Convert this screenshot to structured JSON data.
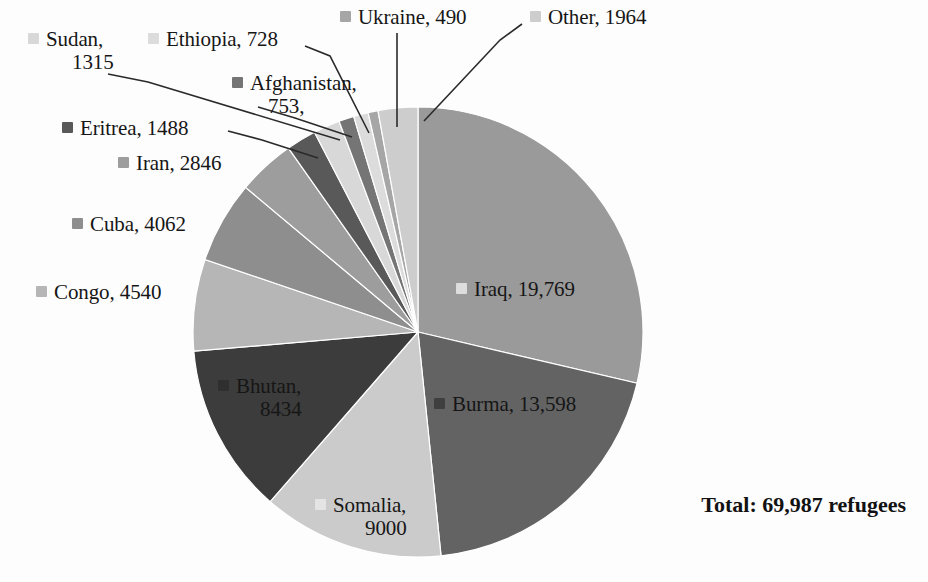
{
  "chart_data": {
    "type": "pie",
    "title": "",
    "total_label": "Total: 69,987 refugees",
    "total_value": 69987,
    "units": "refugees",
    "legend_position": "labels-with-leader-lines",
    "start_angle_deg": 0,
    "direction": "clockwise",
    "categories": [
      "Iraq",
      "Burma",
      "Somalia",
      "Bhutan",
      "Congo",
      "Cuba",
      "Iran",
      "Eritrea",
      "Sudan",
      "Afghanistan",
      "Ethiopia",
      "Ukraine",
      "Other"
    ],
    "values": [
      19769,
      13598,
      9000,
      8434,
      4540,
      4062,
      2846,
      1488,
      1315,
      753,
      728,
      490,
      1964
    ],
    "slices": [
      {
        "name": "Iraq",
        "value": 19769,
        "label": "Iraq, 19,769",
        "color": "#9a9a9a"
      },
      {
        "name": "Burma",
        "value": 13598,
        "label": "Burma, 13,598",
        "color": "#636363"
      },
      {
        "name": "Somalia",
        "value": 9000,
        "label": "Somalia,",
        "label_line2": "9000",
        "color": "#cbcbcb"
      },
      {
        "name": "Bhutan",
        "value": 8434,
        "label": "Bhutan,",
        "label_line2": "8434",
        "color": "#3c3c3c"
      },
      {
        "name": "Congo",
        "value": 4540,
        "label": "Congo, 4540",
        "color": "#b6b6b6"
      },
      {
        "name": "Cuba",
        "value": 4062,
        "label": "Cuba, 4062",
        "color": "#8e8e8e"
      },
      {
        "name": "Iran",
        "value": 2846,
        "label": "Iran, 2846",
        "color": "#9d9d9d"
      },
      {
        "name": "Eritrea",
        "value": 1488,
        "label": "Eritrea, 1488",
        "color": "#595959"
      },
      {
        "name": "Sudan",
        "value": 1315,
        "label": "Sudan,",
        "label_line2": "1315",
        "color": "#d8d8d8"
      },
      {
        "name": "Afghanistan",
        "value": 753,
        "label": "Afghanistan,",
        "label_line2": "753,",
        "color": "#757575"
      },
      {
        "name": "Ethiopia",
        "value": 728,
        "label": "Ethiopia, 728",
        "color": "#dcdcdc"
      },
      {
        "name": "Ukraine",
        "value": 490,
        "label": "Ukraine, 490",
        "color": "#a6a6a6"
      },
      {
        "name": "Other",
        "value": 1964,
        "label": "Other, 1964",
        "color": "#cdcdcd"
      }
    ],
    "geometry": {
      "cx": 418,
      "cy": 332,
      "r": 225
    }
  },
  "labels": {
    "sudan_l1": "Sudan,",
    "sudan_l2": "1315",
    "ethiopia": "Ethiopia, 728",
    "afghanistan_l1": "Afghanistan,",
    "afghanistan_l2": "753,",
    "ukraine": "Ukraine, 490",
    "other": "Other, 1964",
    "eritrea": "Eritrea, 1488",
    "iran": "Iran, 2846",
    "cuba": "Cuba, 4062",
    "congo": "Congo, 4540",
    "iraq": "Iraq, 19,769",
    "burma": "Burma, 13,598",
    "bhutan_l1": "Bhutan,",
    "bhutan_l2": "8434",
    "somalia_l1": "Somalia,",
    "somalia_l2": "9000",
    "total": "Total: 69,987 refugees"
  }
}
